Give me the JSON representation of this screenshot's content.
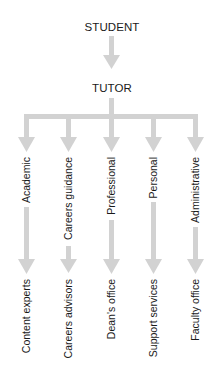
{
  "diagram": {
    "type": "hierarchy-flow",
    "arrow_color": "#d2d2d2",
    "text_color": "#1a1a1a",
    "root": {
      "label": "STUDENT"
    },
    "middle": {
      "label": "TUTOR"
    },
    "branches": [
      {
        "role": "Academic",
        "referral": "Content experts"
      },
      {
        "role": "Careers guidance",
        "referral": "Careers advisors"
      },
      {
        "role": "Professional",
        "referral": "Dean's office"
      },
      {
        "role": "Personal",
        "referral": "Support services"
      },
      {
        "role": "Administrative",
        "referral": "Faculty office"
      }
    ]
  }
}
